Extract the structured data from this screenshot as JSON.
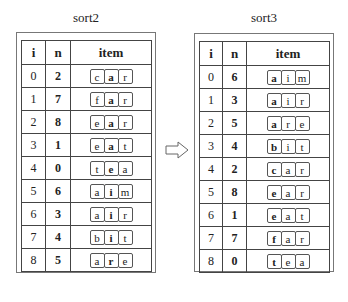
{
  "left": {
    "title": "sort2",
    "headers": [
      "i",
      "n",
      "item"
    ],
    "bold_position": 1,
    "rows": [
      {
        "i": "0",
        "n": "2",
        "chars": [
          "c",
          "a",
          "r"
        ]
      },
      {
        "i": "1",
        "n": "7",
        "chars": [
          "f",
          "a",
          "r"
        ]
      },
      {
        "i": "2",
        "n": "8",
        "chars": [
          "e",
          "a",
          "r"
        ]
      },
      {
        "i": "3",
        "n": "1",
        "chars": [
          "e",
          "a",
          "t"
        ]
      },
      {
        "i": "4",
        "n": "0",
        "chars": [
          "t",
          "e",
          "a"
        ]
      },
      {
        "i": "5",
        "n": "6",
        "chars": [
          "a",
          "i",
          "m"
        ]
      },
      {
        "i": "6",
        "n": "3",
        "chars": [
          "a",
          "i",
          "r"
        ]
      },
      {
        "i": "7",
        "n": "4",
        "chars": [
          "b",
          "i",
          "t"
        ]
      },
      {
        "i": "8",
        "n": "5",
        "chars": [
          "a",
          "r",
          "e"
        ]
      }
    ]
  },
  "right": {
    "title": "sort3",
    "headers": [
      "i",
      "n",
      "item"
    ],
    "bold_position": 0,
    "rows": [
      {
        "i": "0",
        "n": "6",
        "chars": [
          "a",
          "i",
          "m"
        ]
      },
      {
        "i": "1",
        "n": "3",
        "chars": [
          "a",
          "i",
          "r"
        ]
      },
      {
        "i": "2",
        "n": "5",
        "chars": [
          "a",
          "r",
          "e"
        ]
      },
      {
        "i": "3",
        "n": "4",
        "chars": [
          "b",
          "i",
          "t"
        ]
      },
      {
        "i": "4",
        "n": "2",
        "chars": [
          "c",
          "a",
          "r"
        ]
      },
      {
        "i": "5",
        "n": "8",
        "chars": [
          "e",
          "a",
          "r"
        ]
      },
      {
        "i": "6",
        "n": "1",
        "chars": [
          "e",
          "a",
          "t"
        ]
      },
      {
        "i": "7",
        "n": "7",
        "chars": [
          "f",
          "a",
          "r"
        ]
      },
      {
        "i": "8",
        "n": "0",
        "chars": [
          "t",
          "e",
          "a"
        ]
      }
    ]
  },
  "arrow": {
    "icon": "right-hollow-arrow-icon",
    "meaning": "transforms into"
  }
}
